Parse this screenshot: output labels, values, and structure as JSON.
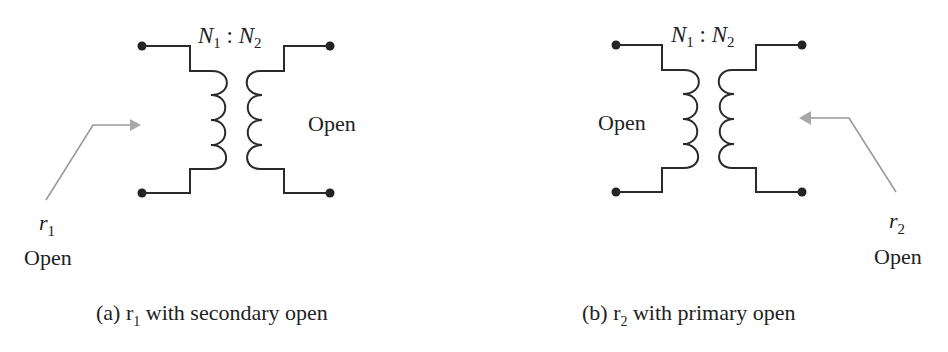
{
  "panels": [
    {
      "id": "a",
      "ratio": {
        "n1": "N",
        "n1_sub": "1",
        "sep": " : ",
        "n2": "N",
        "n2_sub": "2"
      },
      "open_side_label": "Open",
      "measured": {
        "symbol": "r",
        "sub": "1",
        "state": "Open"
      },
      "caption": {
        "prefix": "(a) r",
        "sub": "1",
        "suffix": " with secondary open"
      }
    },
    {
      "id": "b",
      "ratio": {
        "n1": "N",
        "n1_sub": "1",
        "sep": " : ",
        "n2": "N",
        "n2_sub": "2"
      },
      "open_side_label": "Open",
      "measured": {
        "symbol": "r",
        "sub": "2",
        "state": "Open"
      },
      "caption": {
        "prefix": "(b) r",
        "sub": "2",
        "suffix": " with primary open"
      }
    }
  ],
  "colors": {
    "wire": "#2a2a2a",
    "arrow": "#9a9a9a",
    "text": "#222222"
  }
}
